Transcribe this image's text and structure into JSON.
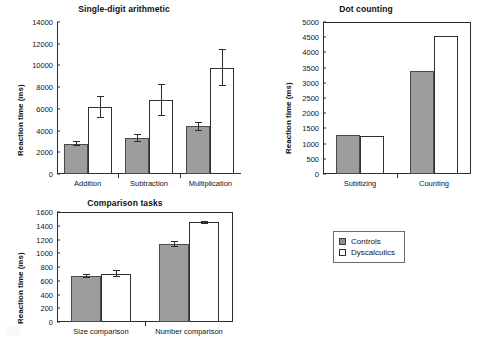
{
  "figure": {
    "legend": {
      "entries": [
        {
          "label": "Controls",
          "marker": "filled-square",
          "color": "#9d9d9d"
        },
        {
          "label": "Dyscalculics",
          "marker": "open-square",
          "color": "#ffffff"
        }
      ]
    }
  },
  "chart_data": [
    {
      "type": "bar",
      "title": "Single-digit arithmetic",
      "xlabel": "",
      "ylabel": "Reaction time (ms)",
      "ylim": [
        0,
        14000
      ],
      "yticks": [
        0,
        2000,
        4000,
        6000,
        8000,
        10000,
        12000,
        14000
      ],
      "grid": false,
      "legend_position": "external-bottom-right",
      "categories": [
        "Addition",
        "Subtraction",
        "Multiplication"
      ],
      "series": [
        {
          "name": "Controls",
          "values": [
            2800,
            3300,
            4400
          ],
          "errors": [
            250,
            350,
            400
          ]
        },
        {
          "name": "Dyscalculics",
          "values": [
            6200,
            6800,
            9800
          ],
          "errors": [
            1000,
            1450,
            1700
          ]
        }
      ]
    },
    {
      "type": "bar",
      "title": "Dot counting",
      "xlabel": "",
      "ylabel": "Reaction time (ms)",
      "ylim": [
        0,
        5000
      ],
      "yticks": [
        0,
        500,
        1000,
        1500,
        2000,
        2500,
        3000,
        3500,
        4000,
        4500,
        5000
      ],
      "grid": false,
      "legend_position": "external-bottom-right",
      "categories": [
        "Subitizing",
        "Counting"
      ],
      "series": [
        {
          "name": "Controls",
          "values": [
            1290,
            3380
          ],
          "errors": [
            0,
            0
          ]
        },
        {
          "name": "Dyscalculics",
          "values": [
            1265,
            4540
          ],
          "errors": [
            0,
            0
          ]
        }
      ]
    },
    {
      "type": "bar",
      "title": "Comparison tasks",
      "xlabel": "",
      "ylabel": "Reaction time (ms)",
      "ylim": [
        0,
        1600
      ],
      "yticks": [
        0,
        200,
        400,
        600,
        800,
        1000,
        1200,
        1400,
        1600
      ],
      "grid": false,
      "legend_position": "external-right",
      "categories": [
        "Size comparison",
        "Number comparison"
      ],
      "series": [
        {
          "name": "Controls",
          "values": [
            672,
            1135
          ],
          "errors": [
            30,
            40
          ]
        },
        {
          "name": "Dyscalculics",
          "values": [
            705,
            1450
          ],
          "errors": [
            55,
            25
          ]
        }
      ]
    }
  ]
}
